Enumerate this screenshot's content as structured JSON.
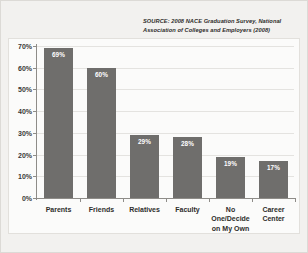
{
  "source_note": "SOURCE: 2008 NACE Graduation Survey, National Association of Colleges and Employers (2008)",
  "colors": {
    "bar": "#6f6e6c",
    "panel": "#fbfbfa",
    "page": "#f2f1ef",
    "axis": "#8e8c88",
    "grid": "#e4e3e0",
    "text": "#2e2d2b",
    "value_label": "#ffffff"
  },
  "chart_data": {
    "type": "bar",
    "title": "",
    "xlabel": "",
    "ylabel": "",
    "categories": [
      "Parents",
      "Friends",
      "Relatives",
      "Faculty",
      "No One/Decide on My Own",
      "Career Center"
    ],
    "category_lines": [
      [
        "Parents"
      ],
      [
        "Friends"
      ],
      [
        "Relatives"
      ],
      [
        "Faculty"
      ],
      [
        "No One/Decide",
        "on My Own"
      ],
      [
        "Career",
        "Center"
      ]
    ],
    "values": [
      69,
      60,
      29,
      28,
      19,
      17
    ],
    "value_labels": [
      "69%",
      "60%",
      "29%",
      "28%",
      "19%",
      "17%"
    ],
    "ylim": [
      0,
      70
    ],
    "yticks": [
      0,
      10,
      20,
      30,
      40,
      50,
      60,
      70
    ],
    "ytick_labels": [
      "0%",
      "10%",
      "20%",
      "30%",
      "40%",
      "50%",
      "60%",
      "70%"
    ],
    "grid": true,
    "legend": false,
    "legend_position": "none"
  }
}
